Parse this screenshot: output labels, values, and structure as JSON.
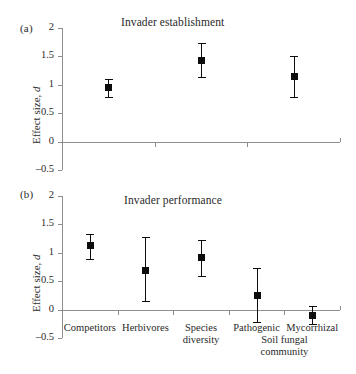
{
  "chart_data": [
    {
      "type": "scatter",
      "panel": "(a)",
      "title": "Invader establishment",
      "xlabel": "",
      "ylabel": "Effect size, d",
      "ylim": [
        -0.5,
        2
      ],
      "yticks": [
        2,
        1.5,
        1,
        0.5,
        0,
        -0.5
      ],
      "ytick_labels": [
        "2",
        "1.5",
        "1",
        "0.5",
        "0",
        "-0.5"
      ],
      "grid": false,
      "zero_line": true,
      "categories": [
        "Competitors",
        "Herbivores",
        "Species diversity"
      ],
      "values": [
        0.95,
        1.43,
        1.14
      ],
      "error_low": [
        0.79,
        1.13,
        0.78
      ],
      "error_high": [
        1.11,
        1.73,
        1.5
      ]
    },
    {
      "type": "scatter",
      "panel": "(b)",
      "title": "Invader performance",
      "xlabel": "",
      "ylabel": "Effect size, d",
      "ylim": [
        -0.5,
        2
      ],
      "yticks": [
        2,
        1.5,
        1,
        0.5,
        0,
        -0.5
      ],
      "ytick_labels": [
        "2",
        "1.5",
        "1",
        "0.5",
        "0",
        "-0.5"
      ],
      "grid": false,
      "zero_line": true,
      "categories": [
        "Competitors",
        "Herbivores",
        "Species diversity",
        "Pathogenic",
        "Mycorrhizal"
      ],
      "values": [
        1.12,
        0.69,
        0.91,
        0.25,
        -0.1
      ],
      "error_low": [
        0.89,
        0.16,
        0.6,
        -0.21,
        -0.26
      ],
      "error_high": [
        1.33,
        1.27,
        1.22,
        0.73,
        0.06
      ]
    }
  ],
  "panel_a": {
    "label": "(a)",
    "title": "Invader establishment",
    "ylabel_prefix": "Effect size, ",
    "ylabel_italic": "d",
    "ytick_labels": [
      "2",
      "1.5",
      "1",
      "0.5",
      "0",
      "–0.5"
    ]
  },
  "panel_b": {
    "label": "(b)",
    "title": "Invader performance",
    "ylabel_prefix": "Effect size, ",
    "ylabel_italic": "d",
    "ytick_labels": [
      "2",
      "1.5",
      "1",
      "0.5",
      "0",
      "–0.5"
    ],
    "categories": [
      {
        "line1": "Competitors",
        "line2": ""
      },
      {
        "line1": "Herbivores",
        "line2": ""
      },
      {
        "line1": "Species",
        "line2": "diversity"
      },
      {
        "line1": "Pathogenic",
        "line2": ""
      },
      {
        "line1": "Mycorrhizal",
        "line2": ""
      }
    ],
    "group_label": {
      "line1": "Soil fungal",
      "line2": "community"
    }
  },
  "colors": {
    "marker": "#0d0d0d",
    "axis": "#8e8e8e",
    "text": "#2a2a2a",
    "background": "#ffffff"
  }
}
